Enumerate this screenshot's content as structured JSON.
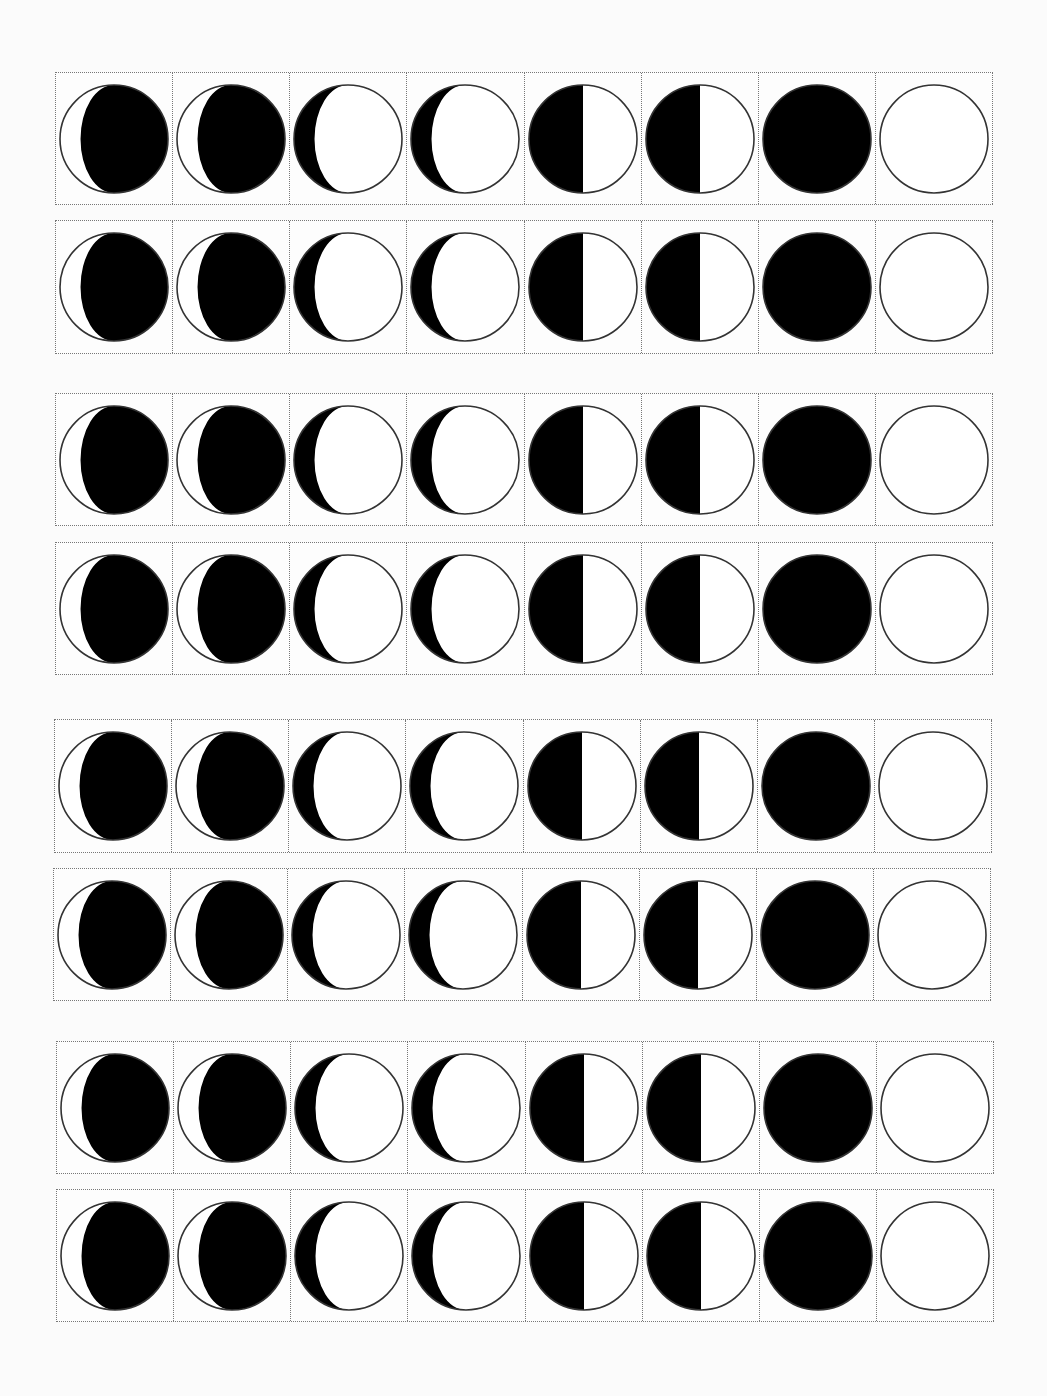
{
  "page": {
    "colors": {
      "dark": "#000000",
      "light": "#ffffff",
      "outline": "#333333",
      "border": "#777777"
    }
  },
  "phases": [
    {
      "name": "gibbous-dark",
      "type": "gibbous",
      "dark_side": "right"
    },
    {
      "name": "gibbous-dark",
      "type": "gibbous",
      "dark_side": "right"
    },
    {
      "name": "crescent-dark",
      "type": "crescent",
      "dark_side": "left"
    },
    {
      "name": "crescent-dark",
      "type": "crescent",
      "dark_side": "left"
    },
    {
      "name": "half",
      "type": "half",
      "dark_side": "left"
    },
    {
      "name": "half",
      "type": "half",
      "dark_side": "left"
    },
    {
      "name": "new-moon",
      "type": "full-dark"
    },
    {
      "name": "full-moon",
      "type": "full-light"
    }
  ],
  "strips": [
    {
      "top": 72,
      "left": 55,
      "height": 133,
      "width": 938
    },
    {
      "top": 220,
      "left": 55,
      "height": 134,
      "width": 938
    },
    {
      "top": 393,
      "left": 55,
      "height": 133,
      "width": 938
    },
    {
      "top": 542,
      "left": 55,
      "height": 133,
      "width": 938
    },
    {
      "top": 719,
      "left": 54,
      "height": 134,
      "width": 938
    },
    {
      "top": 868,
      "left": 53,
      "height": 133,
      "width": 938
    },
    {
      "top": 1041,
      "left": 56,
      "height": 133,
      "width": 938
    },
    {
      "top": 1189,
      "left": 56,
      "height": 133,
      "width": 938
    }
  ]
}
